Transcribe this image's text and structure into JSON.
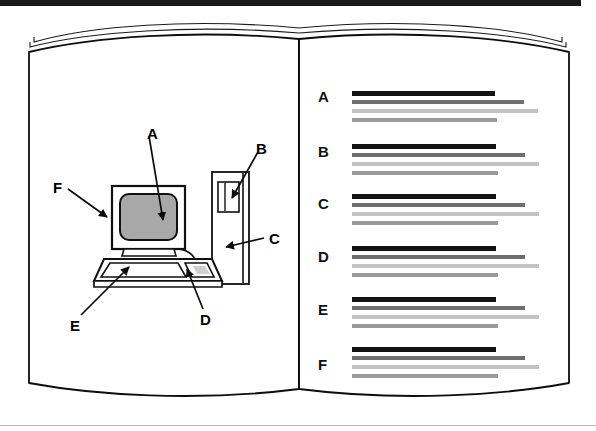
{
  "figure": {
    "type": "open-book-diagram",
    "title_bar_color": "#1a1a1a",
    "page_color": "#ffffff",
    "ink_color": "#000000",
    "screen_fill_color": "#a8a8a8"
  },
  "left_page": {
    "name": "computer-workstation-illustration",
    "callouts": [
      {
        "id": "A",
        "label": "A",
        "target": "monitor-screen",
        "label_x": 147,
        "label_y": 126,
        "tip_x": 163,
        "tip_y": 222,
        "start_x": 149,
        "start_y": 136
      },
      {
        "id": "B",
        "label": "B",
        "target": "tower-drive-slot",
        "label_x": 260,
        "label_y": 141,
        "tip_x": 231,
        "tip_y": 200,
        "start_x": 258,
        "start_y": 151
      },
      {
        "id": "C",
        "label": "C",
        "target": "tower-case",
        "label_x": 271,
        "label_y": 232,
        "tip_x": 225,
        "tip_y": 247,
        "start_x": 265,
        "start_y": 238
      },
      {
        "id": "D",
        "label": "D",
        "target": "mouse-pointing-device",
        "label_x": 205,
        "label_y": 318,
        "tip_x": 186,
        "tip_y": 267,
        "start_x": 203,
        "start_y": 310
      },
      {
        "id": "E",
        "label": "E",
        "target": "keyboard",
        "label_x": 74,
        "label_y": 324,
        "tip_x": 128,
        "tip_y": 266,
        "start_x": 80,
        "start_y": 316
      },
      {
        "id": "F",
        "label": "F",
        "target": "monitor-case",
        "label_x": 56,
        "label_y": 181,
        "tip_x": 106,
        "tip_y": 216,
        "start_x": 68,
        "start_y": 188
      }
    ],
    "parts": {
      "monitor": "crt-monitor",
      "screen": "display-screen",
      "keyboard": "keyboard",
      "mouse": "mouse",
      "tower": "computer-tower",
      "drive_slot": "disk-drive-slot",
      "cable": "monitor-to-tower-cable"
    }
  },
  "right_page": {
    "name": "legend-text-block-list",
    "entry_label_x": 318,
    "line_start_x": 352,
    "colors": {
      "heading": "#121212",
      "line2": "#6e6e6e",
      "line3": "#c3c3c3",
      "line4": "#9a9a9a"
    },
    "entries": [
      {
        "key": "A",
        "label": "A",
        "label_y": 89,
        "lines": [
          {
            "y": 91,
            "width": 143,
            "color": "#121212",
            "height": 5
          },
          {
            "y": 100,
            "width": 172,
            "color": "#6e6e6e",
            "height": 4
          },
          {
            "y": 109,
            "width": 186,
            "color": "#c3c3c3",
            "height": 4
          },
          {
            "y": 118,
            "width": 145,
            "color": "#9a9a9a",
            "height": 4
          }
        ]
      },
      {
        "key": "B",
        "label": "B",
        "label_y": 144,
        "lines": [
          {
            "y": 144,
            "width": 144,
            "color": "#121212",
            "height": 5
          },
          {
            "y": 153,
            "width": 173,
            "color": "#6e6e6e",
            "height": 4
          },
          {
            "y": 162,
            "width": 187,
            "color": "#c3c3c3",
            "height": 4
          },
          {
            "y": 171,
            "width": 146,
            "color": "#9a9a9a",
            "height": 4
          }
        ]
      },
      {
        "key": "C",
        "label": "C",
        "label_y": 196,
        "lines": [
          {
            "y": 194,
            "width": 144,
            "color": "#121212",
            "height": 5
          },
          {
            "y": 203,
            "width": 173,
            "color": "#6e6e6e",
            "height": 4
          },
          {
            "y": 212,
            "width": 187,
            "color": "#c3c3c3",
            "height": 4
          },
          {
            "y": 221,
            "width": 146,
            "color": "#9a9a9a",
            "height": 4
          }
        ]
      },
      {
        "key": "D",
        "label": "D",
        "label_y": 249,
        "lines": [
          {
            "y": 246,
            "width": 144,
            "color": "#121212",
            "height": 5
          },
          {
            "y": 255,
            "width": 173,
            "color": "#6e6e6e",
            "height": 4
          },
          {
            "y": 264,
            "width": 187,
            "color": "#c3c3c3",
            "height": 4
          },
          {
            "y": 273,
            "width": 146,
            "color": "#9a9a9a",
            "height": 4
          }
        ]
      },
      {
        "key": "E",
        "label": "E",
        "label_y": 302,
        "lines": [
          {
            "y": 297,
            "width": 144,
            "color": "#121212",
            "height": 5
          },
          {
            "y": 306,
            "width": 173,
            "color": "#6e6e6e",
            "height": 4
          },
          {
            "y": 315,
            "width": 187,
            "color": "#c3c3c3",
            "height": 4
          },
          {
            "y": 324,
            "width": 146,
            "color": "#9a9a9a",
            "height": 4
          }
        ]
      },
      {
        "key": "F",
        "label": "F",
        "label_y": 357,
        "lines": [
          {
            "y": 347,
            "width": 144,
            "color": "#121212",
            "height": 5
          },
          {
            "y": 356,
            "width": 173,
            "color": "#6e6e6e",
            "height": 4
          },
          {
            "y": 365,
            "width": 187,
            "color": "#c3c3c3",
            "height": 4
          },
          {
            "y": 374,
            "width": 146,
            "color": "#9a9a9a",
            "height": 4
          }
        ]
      }
    ]
  }
}
